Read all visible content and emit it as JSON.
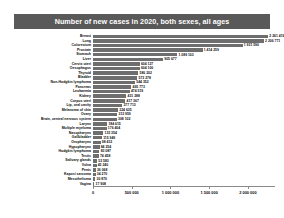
{
  "chart": {
    "title": "Number of new cases in 2020, both sexes, all ages",
    "accent_color": "#6e6e6e",
    "banner_color": "#595959"
  },
  "chart_data": {
    "type": "bar",
    "orientation": "horizontal",
    "title": "Number of new cases in 2020, both sexes, all ages",
    "xlabel": "",
    "ylabel": "",
    "xlim": [
      0,
      2350000
    ],
    "grid": false,
    "legend": null,
    "xticks": [
      "0",
      "500 000",
      "1 000 000",
      "1 500 000",
      "2 000 000"
    ],
    "xtick_values": [
      0,
      500000,
      1000000,
      1500000,
      2000000
    ],
    "categories": [
      "Breast",
      "Lung",
      "Colorectum",
      "Prostate",
      "Stomach",
      "Liver",
      "Cervix uteri",
      "Oesophagus",
      "Thyroid",
      "Bladder",
      "Non-Hodgkin lymphoma",
      "Pancreas",
      "Leukaemia",
      "Kidney",
      "Corpus uteri",
      "Lip, oral cavity",
      "Melanoma of skin",
      "Ovary",
      "Brain, central nervous system",
      "Larynx",
      "Multiple myeloma",
      "Nasopharynx",
      "Gallbladder",
      "Oropharynx",
      "Hypopharynx",
      "Hodgkin lymphoma",
      "Testis",
      "Salivary glands",
      "Vulva",
      "Penis",
      "Kaposi sarcoma",
      "Mesothelioma",
      "Vagina"
    ],
    "values": [
      2261419,
      2206771,
      1931590,
      1414259,
      1089103,
      905677,
      604127,
      604100,
      586202,
      573278,
      544352,
      495773,
      474519,
      431288,
      417367,
      377713,
      324635,
      313959,
      308102,
      184615,
      176404,
      133354,
      115949,
      98412,
      84254,
      83087,
      74458,
      53583,
      45240,
      36068,
      34270,
      30870,
      17908
    ],
    "value_labels": [
      "2 261 419",
      "2 206 771",
      "1 931 590",
      "1 414 259",
      "1 089 103",
      "905 677",
      "604 127",
      "604 100",
      "586 202",
      "573 278",
      "544 352",
      "495 773",
      "474 519",
      "431 288",
      "417 367",
      "377 713",
      "324 635",
      "313 959",
      "308 102",
      "184 615",
      "176 404",
      "133 354",
      "115 949",
      "98 412",
      "84 254",
      "83 087",
      "74 458",
      "53 583",
      "45 240",
      "36 068",
      "34 270",
      "30 870",
      "17 908"
    ]
  }
}
